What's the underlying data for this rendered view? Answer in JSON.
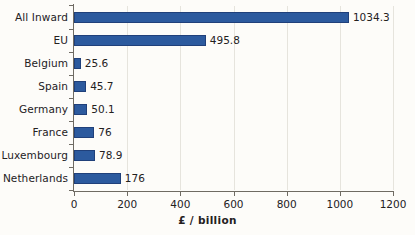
{
  "chart_data": {
    "type": "bar",
    "orientation": "horizontal",
    "title": "",
    "subtitle": "",
    "xlabel": "£ / billion",
    "ylabel": "",
    "xlim": [
      0,
      1200
    ],
    "xticks": [
      0,
      200,
      400,
      600,
      800,
      1000,
      1200
    ],
    "xtick_labels": [
      "0",
      "200",
      "400",
      "600",
      "800",
      "1000",
      "1200"
    ],
    "grid": "vertical",
    "legend": "none",
    "bar_color": "#2C5A9E",
    "bar_edge_color": "#20407A",
    "background_color": "#FDFCF9",
    "categories": [
      "All Inward",
      "EU",
      "Belgium",
      "Spain",
      "Germany",
      "France",
      "Luxembourg",
      "Netherlands"
    ],
    "values": [
      1034.3,
      495.8,
      25.6,
      45.7,
      50.1,
      76,
      78.9,
      176
    ],
    "value_labels": [
      "1034.3",
      "495.8",
      "25.6",
      "45.7",
      "50.1",
      "76",
      "78.9",
      "176"
    ],
    "bars": [
      {
        "category": "All Inward",
        "value": 1034.3,
        "label": "1034.3"
      },
      {
        "category": "EU",
        "value": 495.8,
        "label": "495.8"
      },
      {
        "category": "Belgium",
        "value": 25.6,
        "label": "25.6"
      },
      {
        "category": "Spain",
        "value": 45.7,
        "label": "45.7"
      },
      {
        "category": "Germany",
        "value": 50.1,
        "label": "50.1"
      },
      {
        "category": "France",
        "value": 76,
        "label": "76"
      },
      {
        "category": "Luxembourg",
        "value": 78.9,
        "label": "78.9"
      },
      {
        "category": "Netherlands",
        "value": 176,
        "label": "176"
      }
    ]
  }
}
